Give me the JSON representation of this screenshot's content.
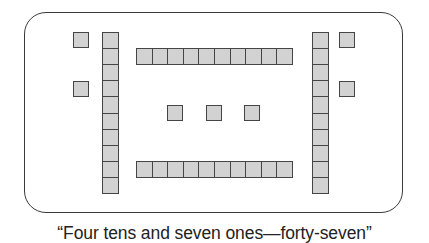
{
  "figure": {
    "caption": "“Four tens and seven ones—forty-seven”",
    "number_represented": 47,
    "tens": 4,
    "ones": 7,
    "colors": {
      "block_fill": "#d2d2d2",
      "block_border": "#454545",
      "frame_border": "#3a3a3a"
    },
    "ten_rods": [
      {
        "id": "left-vertical",
        "orientation": "vertical",
        "units": 10,
        "x": 102,
        "y": 32
      },
      {
        "id": "top-horizontal",
        "orientation": "horizontal",
        "units": 10,
        "x": 136,
        "y": 48
      },
      {
        "id": "bottom-horizontal",
        "orientation": "horizontal",
        "units": 10,
        "x": 136,
        "y": 161
      },
      {
        "id": "right-vertical",
        "orientation": "vertical",
        "units": 10,
        "x": 312,
        "y": 32
      }
    ],
    "one_cubes": [
      {
        "x": 73,
        "y": 32
      },
      {
        "x": 73,
        "y": 81
      },
      {
        "x": 167,
        "y": 105
      },
      {
        "x": 206,
        "y": 105
      },
      {
        "x": 244,
        "y": 105
      },
      {
        "x": 339,
        "y": 32
      },
      {
        "x": 339,
        "y": 81
      }
    ]
  }
}
